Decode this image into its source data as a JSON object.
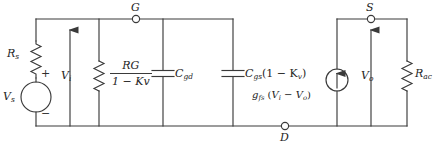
{
  "diagram": {
    "line_color": "#3a3a3a",
    "text_color": "#242424",
    "background": "#ffffff"
  },
  "nodes": [
    {
      "id": "G",
      "label": "G",
      "x": 136,
      "y": 19,
      "label_x": 131,
      "label_y": 4
    },
    {
      "id": "S",
      "label": "S",
      "x": 371,
      "y": 19,
      "label_x": 366,
      "label_y": 4
    },
    {
      "id": "D",
      "label": "D",
      "x": 285,
      "y": 126,
      "label_x": 280,
      "label_y": 131
    }
  ],
  "components": {
    "rs": {
      "name": "Rs",
      "base": "R",
      "sub": "s",
      "label_x": 7,
      "label_y": 44
    },
    "vs": {
      "name": "Vs",
      "base": "V",
      "sub": "s",
      "label_x": 4,
      "label_y": 93,
      "plus": "+",
      "minus": "−",
      "plus_x": 40,
      "plus_y": 73,
      "minus_x": 40,
      "minus_y": 111
    },
    "vi": {
      "name": "Vi",
      "base": "V",
      "sub": "i",
      "label_x": 62,
      "label_y": 72
    },
    "rg": {
      "name": "RG/(1-Kv)",
      "numerator_base": "R",
      "numerator_sub": "G",
      "denominator": "1 − K",
      "denominator_sub": "v",
      "x": 112,
      "y": 61
    },
    "cgd": {
      "name": "Cgd",
      "base": "C",
      "sub": "gd",
      "label_x": 174,
      "label_y": 72
    },
    "cgs": {
      "name": "Cgs(1-Kv)",
      "base": "C",
      "sub": "gs",
      "suffix": "(1 − K",
      "suffix_sub": "v",
      "suffix_end": ")",
      "label_x": 240,
      "label_y": 72
    },
    "source": {
      "name": "gfs(Vi-Vo)",
      "base": "g",
      "sub": "fs",
      "expr_open": "(",
      "expr_v1": "V",
      "expr_v1_sub": "i",
      "expr_minus": " − ",
      "expr_v2": "V",
      "expr_v2_sub": "o",
      "expr_close": ")",
      "label_x": 243,
      "label_y": 93,
      "cx": 337,
      "cy": 80,
      "r": 11
    },
    "vo": {
      "name": "Vo",
      "base": "V",
      "sub": "o",
      "label_x": 362,
      "label_y": 72
    },
    "rac": {
      "name": "Rac",
      "base": "R",
      "sub": "ac",
      "label_x": 414,
      "label_y": 72
    }
  },
  "geometry": {
    "top_rail_y": 19,
    "bottom_rail_y": 126,
    "left_x": 36,
    "branch_vi_x": 70,
    "branch_rg_x": 99,
    "branch_cgd_x": 163,
    "branch_cgs_x": 233,
    "right_rail_x": 407,
    "source_x": 337,
    "branch_vo_x": 371
  }
}
